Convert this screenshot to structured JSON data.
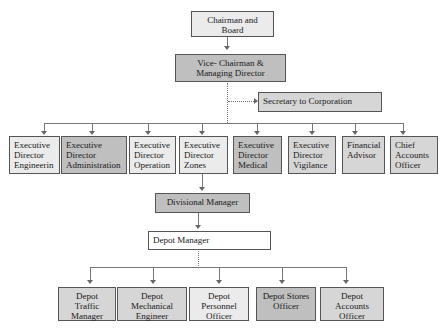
{
  "chart": {
    "top": {
      "chairman": "Chairman and Board",
      "vice_chairman": "Vice- Chairman & Managing Director",
      "secretary": "Secretary to Corporation"
    },
    "executives": [
      {
        "label": "Executive Director Engineerin"
      },
      {
        "label": "Executive Director Administration"
      },
      {
        "label": "Executive Director Operation"
      },
      {
        "label": "Executive Director Zones"
      },
      {
        "label": "Executive Director Medical"
      },
      {
        "label": "Executive Director Vigilance"
      },
      {
        "label": "Financial Advisor"
      },
      {
        "label": "Chief Accounts Officer"
      }
    ],
    "divisional_manager": "Divisional Manager",
    "depot_manager": "Depot Manager",
    "depot_staff": [
      {
        "label": "Depot Traffic Manager"
      },
      {
        "label": "Depot Mechanical Engineer"
      },
      {
        "label": "Depot Personnel Officer"
      },
      {
        "label": "Depot Stores Officer"
      },
      {
        "label": "Depot Accounts Officer"
      }
    ]
  }
}
